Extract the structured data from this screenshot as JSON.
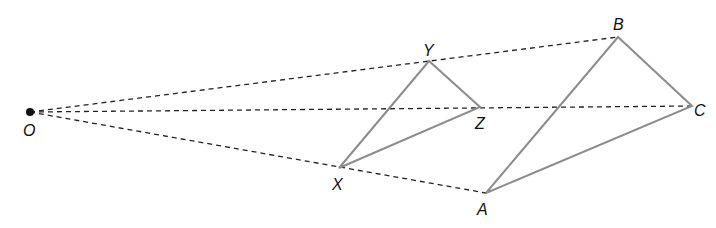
{
  "diagram": {
    "center": {
      "label": "O",
      "x": 30,
      "y": 112
    },
    "small_triangle": {
      "vertices": [
        {
          "label": "X",
          "x": 339,
          "y": 168
        },
        {
          "label": "Y",
          "x": 429,
          "y": 61
        },
        {
          "label": "Z",
          "x": 480,
          "y": 107
        }
      ]
    },
    "large_triangle": {
      "vertices": [
        {
          "label": "A",
          "x": 486,
          "y": 193
        },
        {
          "label": "B",
          "x": 618,
          "y": 37
        },
        {
          "label": "C",
          "x": 692,
          "y": 106
        }
      ]
    },
    "rays": [
      {
        "from": "O",
        "to": "B"
      },
      {
        "from": "O",
        "to": "C"
      },
      {
        "from": "O",
        "to": "A"
      }
    ],
    "labels": {
      "O": "O",
      "X": "X",
      "Y": "Y",
      "Z": "Z",
      "A": "A",
      "B": "B",
      "C": "C"
    },
    "colors": {
      "ray": "#222222",
      "edge": "#8c8c8c",
      "point": "#111111"
    }
  }
}
